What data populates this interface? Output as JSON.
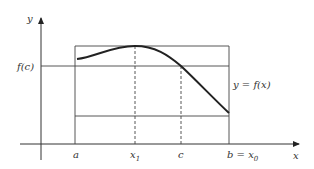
{
  "diagram": {
    "type": "function-graph",
    "axes": {
      "x_label": "x",
      "y_label": "y"
    },
    "y_tick_labels": {
      "fc": "f(c)"
    },
    "x_tick_labels": {
      "a": "a",
      "x1": "x",
      "x1_sub": "1",
      "c": "c",
      "b_prefix": "b = x",
      "b_sub": "0"
    },
    "curve_label": "y = f(x)",
    "colors": {
      "line": "#333333",
      "curve": "#222222",
      "background": "#ffffff"
    }
  }
}
